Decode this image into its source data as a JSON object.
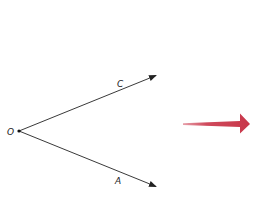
{
  "diagram": {
    "type": "angle-rays",
    "vertex": {
      "label": "O",
      "x": 19,
      "y": 131
    },
    "rays": [
      {
        "label": "C",
        "from": "O",
        "tip": {
          "x": 157,
          "y": 75
        },
        "label_pos": {
          "x": 117,
          "y": 87
        }
      },
      {
        "label": "A",
        "from": "O",
        "tip": {
          "x": 157,
          "y": 187
        },
        "label_pos": {
          "x": 115,
          "y": 184
        }
      }
    ],
    "line_color": "#222222",
    "indicator_arrow": {
      "color": "#c8374a",
      "direction": "right",
      "from": {
        "x": 183,
        "y": 124
      },
      "to": {
        "x": 250,
        "y": 124
      }
    }
  },
  "labels": {
    "vertex": "O",
    "ray_c": "C",
    "ray_a": "A"
  }
}
